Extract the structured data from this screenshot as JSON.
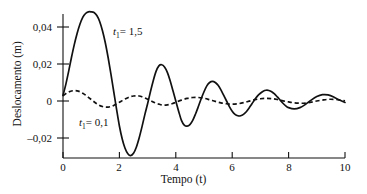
{
  "figure": {
    "background": "#ffffff",
    "ink": "#111111"
  },
  "axes": {
    "x_title": "Tempo (t)",
    "y_title": "Deslocamento (m)",
    "x_ticks": [
      "0",
      "2",
      "4",
      "6",
      "8",
      "10"
    ],
    "y_ticks": [
      "0,04",
      "0,02",
      "0",
      "–0,02"
    ]
  },
  "labels": {
    "solid": {
      "var": "t",
      "sub": "1",
      "value": "= 1,5"
    },
    "dashed": {
      "var": "t",
      "sub": "1",
      "value": "= 0,1"
    }
  },
  "chart_data": {
    "type": "line",
    "title": "",
    "xlabel": "Tempo (t)",
    "ylabel": "Deslocamento (m)",
    "xlim": [
      0,
      10
    ],
    "ylim": [
      -0.03,
      0.052
    ],
    "xticks": [
      0,
      2,
      4,
      6,
      8,
      10
    ],
    "yticks": [
      -0.02,
      0,
      0.02,
      0.04
    ],
    "xtick_labels": [
      "0",
      "2",
      "4",
      "6",
      "8",
      "10"
    ],
    "ytick_labels": [
      "–0,02",
      "0",
      "0,02",
      "0,04"
    ],
    "grid": false,
    "legend": "inline-annotation",
    "series": [
      {
        "name": "t1 = 1,5",
        "style": "solid",
        "color": "#111111",
        "x": [
          0.0,
          0.1,
          0.2,
          0.3,
          0.4,
          0.5,
          0.6,
          0.7,
          0.8,
          0.9,
          1.0,
          1.1,
          1.2,
          1.3,
          1.4,
          1.5,
          1.6,
          1.7,
          1.8,
          1.9,
          2.0,
          2.1,
          2.2,
          2.3,
          2.4,
          2.5,
          2.6,
          2.7,
          2.8,
          2.9,
          3.0,
          3.1,
          3.2,
          3.3,
          3.4,
          3.5,
          3.6,
          3.7,
          3.8,
          3.9,
          4.0,
          4.1,
          4.2,
          4.3,
          4.4,
          4.5,
          4.6,
          4.7,
          4.8,
          4.9,
          5.0,
          5.1,
          5.2,
          5.3,
          5.4,
          5.5,
          5.6,
          5.7,
          5.8,
          5.9,
          6.0,
          6.1,
          6.2,
          6.3,
          6.4,
          6.5,
          6.6,
          6.7,
          6.8,
          6.9,
          7.0,
          7.1,
          7.2,
          7.3,
          7.4,
          7.5,
          7.6,
          7.7,
          7.8,
          7.9,
          8.0,
          8.2,
          8.4,
          8.6,
          8.8,
          9.0,
          9.2,
          9.4,
          9.6,
          9.8,
          10.0
        ],
        "y": [
          0.003,
          0.009,
          0.016,
          0.0235,
          0.0305,
          0.0365,
          0.0415,
          0.0452,
          0.0473,
          0.0482,
          0.0482,
          0.0478,
          0.0462,
          0.043,
          0.038,
          0.0315,
          0.0235,
          0.0145,
          0.005,
          -0.0045,
          -0.0135,
          -0.0205,
          -0.0255,
          -0.0285,
          -0.0295,
          -0.0283,
          -0.025,
          -0.02,
          -0.014,
          -0.0075,
          -0.0015,
          0.005,
          0.011,
          0.016,
          0.019,
          0.0196,
          0.0184,
          0.0155,
          0.011,
          0.0055,
          0.0,
          -0.0055,
          -0.0105,
          -0.013,
          -0.0136,
          -0.0128,
          -0.0105,
          -0.007,
          -0.003,
          0.0012,
          0.005,
          0.0082,
          0.01,
          0.0106,
          0.01,
          0.0085,
          0.006,
          0.003,
          0.0,
          -0.003,
          -0.0055,
          -0.0072,
          -0.008,
          -0.008,
          -0.0072,
          -0.0058,
          -0.0038,
          -0.0015,
          0.0008,
          0.0028,
          0.0042,
          0.0053,
          0.0058,
          0.0057,
          0.005,
          0.0038,
          0.0022,
          0.0005,
          -0.0012,
          -0.0026,
          -0.0036,
          -0.0043,
          -0.0036,
          -0.0018,
          0.0005,
          0.0024,
          0.0034,
          0.0033,
          0.0022,
          0.0005,
          -0.0008
        ],
        "description": "Oscilacao amortecida de maior amplitude, pico de cerca de 0,048 em t proximo de 1,1 e vale de cerca de -0,029 em t proximo de 2,4"
      },
      {
        "name": "t1 = 0,1",
        "style": "dashed",
        "color": "#111111",
        "x": [
          0.0,
          0.1,
          0.2,
          0.3,
          0.4,
          0.5,
          0.6,
          0.7,
          0.8,
          0.9,
          1.0,
          1.1,
          1.2,
          1.3,
          1.4,
          1.5,
          1.6,
          1.7,
          1.8,
          1.9,
          2.0,
          2.1,
          2.2,
          2.3,
          2.4,
          2.5,
          2.6,
          2.7,
          2.8,
          2.9,
          3.0,
          3.1,
          3.2,
          3.3,
          3.4,
          3.5,
          3.6,
          3.7,
          3.8,
          3.9,
          4.0,
          4.2,
          4.4,
          4.6,
          4.8,
          5.0,
          5.2,
          5.4,
          5.6,
          5.8,
          6.0,
          6.2,
          6.4,
          6.6,
          6.8,
          7.0,
          7.2,
          7.4,
          7.6,
          7.8,
          8.0,
          8.2,
          8.4,
          8.6,
          8.8,
          9.0,
          9.2,
          9.4,
          9.6,
          9.8,
          10.0
        ],
        "y": [
          0.0028,
          0.004,
          0.0049,
          0.0054,
          0.0056,
          0.0055,
          0.005,
          0.0042,
          0.0032,
          0.002,
          0.0008,
          -0.0004,
          -0.0015,
          -0.0024,
          -0.003,
          -0.0033,
          -0.0033,
          -0.003,
          -0.0024,
          -0.0016,
          -0.0007,
          0.0002,
          0.0011,
          0.0018,
          0.0024,
          0.0027,
          0.0028,
          0.0027,
          0.0023,
          0.0017,
          0.001,
          0.0003,
          -0.0005,
          -0.0012,
          -0.0017,
          -0.0021,
          -0.0022,
          -0.0021,
          -0.0018,
          -0.0013,
          -0.0007,
          0.0005,
          0.0014,
          0.0019,
          0.0019,
          0.0015,
          0.0007,
          -0.0002,
          -0.001,
          -0.0015,
          -0.0017,
          -0.0015,
          -0.0009,
          -0.0001,
          0.0007,
          0.0012,
          0.0014,
          0.0013,
          0.0008,
          0.0001,
          -0.0005,
          -0.001,
          -0.0012,
          -0.0011,
          -0.0006,
          0.0,
          0.0005,
          0.0009,
          0.0009,
          0.0006,
          0.0001
        ],
        "description": "Oscilacao amortecida de pequena amplitude, pico de cerca de 0,0056 em t proximo de 0,4"
      }
    ]
  }
}
